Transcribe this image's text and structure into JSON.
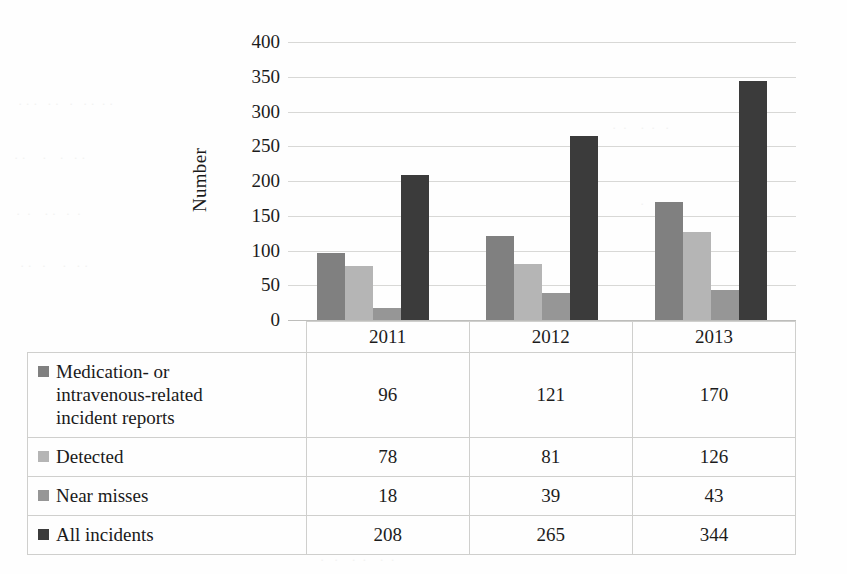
{
  "chart_data": {
    "type": "bar",
    "title": "",
    "xlabel": "",
    "ylabel": "Number",
    "categories": [
      "2011",
      "2012",
      "2013"
    ],
    "ylim": [
      0,
      400
    ],
    "ytick_values": [
      400,
      350,
      300,
      250,
      200,
      150,
      100,
      50,
      0
    ],
    "ytick_labels": [
      "400",
      "350",
      "300",
      "250",
      "200",
      "150",
      "100",
      "50",
      "0"
    ],
    "grid": true,
    "legend_position": "table-below",
    "series": [
      {
        "name": "Medication- or intravenous-related incident reports",
        "color": "#808080",
        "values": [
          96,
          121,
          170
        ]
      },
      {
        "name": "Detected",
        "color": "#b5b5b5",
        "values": [
          78,
          81,
          126
        ]
      },
      {
        "name": "Near misses",
        "color": "#969696",
        "values": [
          18,
          39,
          43
        ]
      },
      {
        "name": "All incidents",
        "color": "#3b3b3b",
        "values": [
          208,
          265,
          344
        ]
      }
    ]
  },
  "axis": {
    "y_title": "Number"
  },
  "table": {
    "category_row": [
      "2011",
      "2012",
      "2013"
    ],
    "rows": [
      {
        "label_lines": [
          "Medication- or",
          "intravenous-related",
          "incident reports"
        ],
        "label": "Medication- or intravenous-related incident reports",
        "swatch_color": "#808080",
        "values": [
          "96",
          "121",
          "170"
        ]
      },
      {
        "label_lines": [
          "Detected"
        ],
        "label": "Detected",
        "swatch_color": "#b5b5b5",
        "values": [
          "78",
          "81",
          "126"
        ]
      },
      {
        "label_lines": [
          "Near misses"
        ],
        "label": "Near misses",
        "swatch_color": "#969696",
        "values": [
          "18",
          "39",
          "43"
        ]
      },
      {
        "label_lines": [
          "All incidents"
        ],
        "label": "All incidents",
        "swatch_color": "#3b3b3b",
        "values": [
          "208",
          "265",
          "344"
        ]
      }
    ]
  }
}
